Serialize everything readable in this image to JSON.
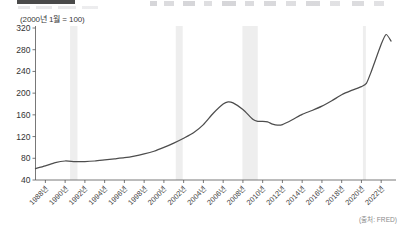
{
  "header": {
    "bar_label": "",
    "note": ""
  },
  "subtitle": "(2000년 1월 = 100)",
  "source": "(출처: FRED)",
  "chart_data": {
    "type": "line",
    "title": "",
    "subtitle": "(2000년 1월 = 100)",
    "xlabel": "",
    "ylabel": "",
    "ylim": [
      40,
      320
    ],
    "xlim": [
      1987.0,
      2023.5
    ],
    "yticks": [
      40,
      80,
      120,
      160,
      200,
      240,
      280,
      320
    ],
    "xticks": [
      1988,
      1990,
      1992,
      1994,
      1996,
      1998,
      2000,
      2002,
      2004,
      2006,
      2008,
      2010,
      2012,
      2014,
      2016,
      2018,
      2020,
      2022
    ],
    "xtick_labels": [
      "1988년",
      "1990년",
      "1992년",
      "1994년",
      "1996년",
      "1998년",
      "2000년",
      "2002년",
      "2004년",
      "2006년",
      "2008년",
      "2010년",
      "2012년",
      "2014년",
      "2016년",
      "2018년",
      "2020년",
      "2022년"
    ],
    "grid": false,
    "legend": null,
    "line_color": "#4d4d4d",
    "shade_color": "#eeeeee",
    "recession_bands": [
      {
        "start": 1990.5,
        "end": 1991.25
      },
      {
        "start": 2001.2,
        "end": 2001.9
      },
      {
        "start": 2007.95,
        "end": 2009.5
      },
      {
        "start": 2020.15,
        "end": 2020.45
      }
    ],
    "x": [
      1987.0,
      1988.0,
      1989.0,
      1990.0,
      1991.0,
      1992.0,
      1993.0,
      1994.0,
      1995.0,
      1996.0,
      1997.0,
      1998.0,
      1999.0,
      2000.0,
      2001.0,
      2002.0,
      2003.0,
      2004.0,
      2005.0,
      2006.0,
      2006.5,
      2007.0,
      2008.0,
      2009.0,
      2009.5,
      2010.0,
      2010.5,
      2011.0,
      2011.5,
      2012.0,
      2013.0,
      2014.0,
      2015.0,
      2016.0,
      2017.0,
      2018.0,
      2019.0,
      2020.0,
      2020.5,
      2021.0,
      2022.0,
      2022.5,
      2023.0
    ],
    "values": [
      61,
      66,
      72,
      75,
      74,
      74,
      75,
      77,
      79,
      81,
      84,
      88,
      93,
      100,
      108,
      117,
      127,
      142,
      163,
      180,
      184,
      182,
      170,
      152,
      148,
      148,
      147,
      143,
      141,
      142,
      151,
      161,
      168,
      176,
      186,
      197,
      205,
      212,
      218,
      240,
      290,
      308,
      296
    ],
    "series_name": "주택가격지수"
  }
}
